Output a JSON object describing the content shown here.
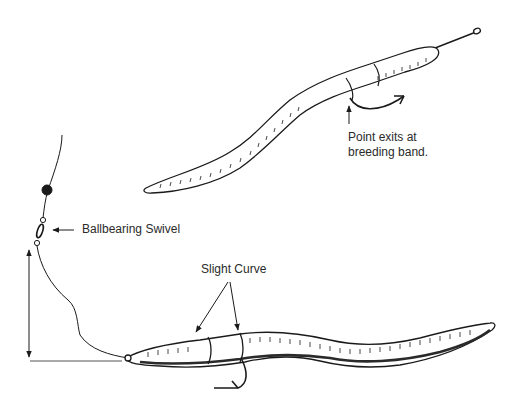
{
  "labels": {
    "point_exits_line1": "Point exits at",
    "point_exits_line2": "breeding band.",
    "swivel": "Ballbearing Swivel",
    "slight_curve": "Slight Curve"
  },
  "elements": {
    "upper_worm": "worm threaded on hook, point exiting at breeding band",
    "lower_worm": "worm rigged on hook with slight curve",
    "line": "fishing line with bead and swivel",
    "leader_dimension": "vertical dimension arrow indicating leader length"
  },
  "colors": {
    "ink": "#1a1a1a",
    "background": "#ffffff"
  }
}
